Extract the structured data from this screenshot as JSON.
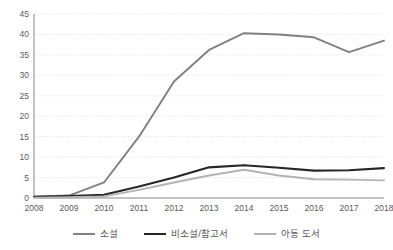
{
  "chart_data": {
    "type": "line",
    "title": "",
    "subtitle": "",
    "xlabel": "",
    "ylabel": "",
    "categories": [
      "2008",
      "2009",
      "2010",
      "2011",
      "2012",
      "2013",
      "2014",
      "2015",
      "2016",
      "2017",
      "2018"
    ],
    "x": [
      2008,
      2009,
      2010,
      2011,
      2012,
      2013,
      2014,
      2015,
      2016,
      2017,
      2018
    ],
    "ylim": [
      0,
      45
    ],
    "xlim": [
      2008,
      2018
    ],
    "yticks": [
      0,
      5,
      10,
      15,
      20,
      25,
      30,
      35,
      40,
      45
    ],
    "ytick_labels": [
      "0",
      "5",
      "10",
      "15",
      "20",
      "25",
      "30",
      "35",
      "40",
      "45"
    ],
    "grid": true,
    "grid_axis": "y",
    "legend_position": "bottom",
    "series": [
      {
        "name": "소설",
        "color": "#808080",
        "width": 1.9,
        "values": [
          0.3,
          0.6,
          3.8,
          15.0,
          28.5,
          36.2,
          40.3,
          40.0,
          39.3,
          35.7,
          38.5
        ]
      },
      {
        "name": "비소설/참고서",
        "color": "#262626",
        "width": 2.1,
        "values": [
          0.3,
          0.5,
          0.8,
          2.8,
          5.0,
          7.5,
          8.0,
          7.4,
          6.7,
          6.8,
          7.3
        ]
      },
      {
        "name": "아동 도서",
        "color": "#b3b3b3",
        "width": 1.9,
        "values": [
          0.1,
          0.2,
          0.4,
          2.0,
          3.8,
          5.5,
          6.9,
          5.5,
          4.6,
          4.5,
          4.3
        ]
      }
    ]
  },
  "legend": {
    "items": [
      {
        "label": "소설",
        "color": "#808080",
        "width": 2
      },
      {
        "label": "비소설/참고서",
        "color": "#262626",
        "width": 2.6
      },
      {
        "label": "아동 도서",
        "color": "#b3b3b3",
        "width": 2
      }
    ]
  },
  "axes": {
    "axis_color": "#868686",
    "grid_color": "#d9d9d9",
    "tick_text_color": "#595959"
  }
}
